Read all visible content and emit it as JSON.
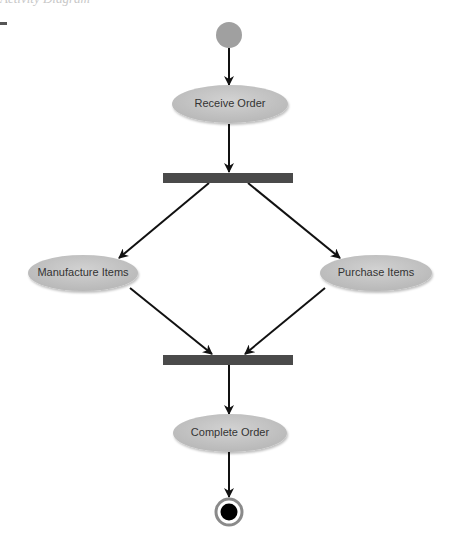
{
  "header": {
    "clipped_text": "Activity Diagram"
  },
  "diagram": {
    "type": "uml-activity",
    "nodes": {
      "start": {
        "label": "",
        "kind": "initial"
      },
      "receive_order": {
        "label": "Receive Order",
        "kind": "activity"
      },
      "fork": {
        "label": "",
        "kind": "fork"
      },
      "manufacture_items": {
        "label": "Manufacture Items",
        "kind": "activity"
      },
      "purchase_items": {
        "label": "Purchase Items",
        "kind": "activity"
      },
      "join": {
        "label": "",
        "kind": "join"
      },
      "complete_order": {
        "label": "Complete Order",
        "kind": "activity"
      },
      "end": {
        "label": "",
        "kind": "final"
      }
    },
    "edges": [
      {
        "from": "start",
        "to": "receive_order"
      },
      {
        "from": "receive_order",
        "to": "fork"
      },
      {
        "from": "fork",
        "to": "manufacture_items"
      },
      {
        "from": "fork",
        "to": "purchase_items"
      },
      {
        "from": "manufacture_items",
        "to": "join"
      },
      {
        "from": "purchase_items",
        "to": "join"
      },
      {
        "from": "join",
        "to": "complete_order"
      },
      {
        "from": "complete_order",
        "to": "end"
      }
    ],
    "colors": {
      "activity_fill": "#c4c4c4",
      "initial_fill": "#a0a0a0",
      "bar_fill": "#4a4a4a",
      "edge": "#111111",
      "final_outer": "#8a8a8a",
      "final_inner": "#000000"
    }
  }
}
